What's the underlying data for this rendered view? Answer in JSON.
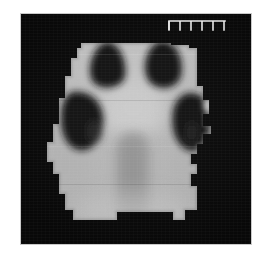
{
  "figure": {
    "modality_appearance": "autoradiograph-coronal-slice",
    "background_color": "#0a0a0a",
    "frame_border_color": "#c9c9c9",
    "canvas_width": 267,
    "canvas_height": 257
  },
  "scale_ruler": {
    "name": "scale-ruler",
    "tick_count": 5,
    "color": "#e8e8e8",
    "orientation": "horizontal-comb-downward-ticks",
    "label": ""
  },
  "specimen": {
    "name": "tissue-slab",
    "fill_color": "#bcbcbc",
    "edge_style": "stepped-pixelated",
    "bounds": {
      "x": 38,
      "y": 29,
      "width": 166,
      "height": 196
    }
  },
  "regions": [
    {
      "name": "dark-blob-upper-left",
      "shape": "rounded-triangle",
      "fill_color": "#131313",
      "center": {
        "x": 87,
        "y": 51
      },
      "radius_x": 24,
      "radius_y": 22
    },
    {
      "name": "dark-blob-upper-right",
      "shape": "oval",
      "fill_color": "#151515",
      "center": {
        "x": 141,
        "y": 50
      },
      "radius_x": 21,
      "radius_y": 23
    },
    {
      "name": "dark-blob-lower-left",
      "shape": "kidney-bean",
      "fill_color": "#141414",
      "center": {
        "x": 59,
        "y": 105
      },
      "radius_x": 21,
      "radius_y": 28
    },
    {
      "name": "dark-blob-lower-right",
      "shape": "kidney-bean",
      "fill_color": "#121212",
      "center": {
        "x": 170,
        "y": 107
      },
      "radius_x": 20,
      "radius_y": 28
    },
    {
      "name": "midline-vertical-band",
      "shape": "vertical-band",
      "fill_color": "#9d9d9d",
      "center": {
        "x": 112,
        "y": 165
      },
      "width": 30,
      "height": 90
    },
    {
      "name": "central-bright-core",
      "shape": "oval",
      "fill_color": "#cfcfcf",
      "center": {
        "x": 112,
        "y": 95
      },
      "radius_x": 30,
      "radius_y": 26
    },
    {
      "name": "highlight-spot-right",
      "shape": "small-dot",
      "fill_color": "#efefef",
      "center": {
        "x": 190,
        "y": 95
      },
      "radius_x": 5,
      "radius_y": 5
    }
  ],
  "grayscale_palette": {
    "background": "#0a0a0a",
    "tissue_light": "#bcbcbc",
    "tissue_bright": "#d2d2d2",
    "tissue_mid": "#a2a2a2",
    "blob_dark": "#131313",
    "ruler": "#e8e8e8",
    "frame": "#c9c9c9"
  }
}
